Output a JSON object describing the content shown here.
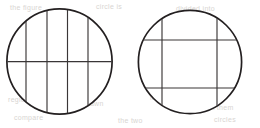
{
  "figure": {
    "name": "two-circles-grid-diagram",
    "width": 260,
    "height": 128,
    "background_color": "#ffffff",
    "stroke_color": "#231f20",
    "inner_stroke_color": "#3a3637",
    "outline_width": 1.6,
    "inner_width": 1.1,
    "caption": "",
    "shapes": [
      {
        "id": "left-circle",
        "label": "Left circle with four vertical chords and one horizontal diameter",
        "center_x": 59.5,
        "center_y": 61.5,
        "radius": 53,
        "vertical_lines": [
          26,
          47,
          67.5,
          88
        ],
        "horizontal_lines": [
          61.5
        ],
        "regions": 10
      },
      {
        "id": "right-circle",
        "label": "Right circle with two vertical chords and two horizontal chords forming a 3 by 3 grid",
        "center_x": 190,
        "center_y": 62,
        "radius": 52,
        "vertical_lines": [
          162,
          217
        ],
        "horizontal_lines": [
          40,
          88
        ],
        "regions": 9
      }
    ]
  },
  "background_bleed": {
    "note": "faint light-gray show-through text from the reverse side of the scanned page",
    "lines": [
      {
        "text": "the figure",
        "x": 10,
        "y": 4,
        "size": 7
      },
      {
        "text": "circle is",
        "x": 96,
        "y": 3,
        "size": 7
      },
      {
        "text": "divided into",
        "x": 176,
        "y": 5,
        "size": 7
      },
      {
        "text": "regions by",
        "x": 8,
        "y": 96,
        "size": 7
      },
      {
        "text": "chords drawn",
        "x": 58,
        "y": 100,
        "size": 7
      },
      {
        "text": "in each",
        "x": 150,
        "y": 94,
        "size": 7
      },
      {
        "text": "count them",
        "x": 196,
        "y": 104,
        "size": 7
      },
      {
        "text": "compare",
        "x": 14,
        "y": 114,
        "size": 7
      },
      {
        "text": "the two",
        "x": 118,
        "y": 117,
        "size": 7
      },
      {
        "text": "circles",
        "x": 214,
        "y": 116,
        "size": 7
      }
    ]
  }
}
